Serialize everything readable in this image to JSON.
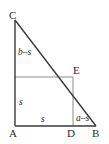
{
  "figure": {
    "type": "geometry-diagram",
    "width": 109,
    "height": 144,
    "background_color": "#ffffff",
    "stroke_color_outline": "#3a3a3a",
    "stroke_color_inner": "#8a8a8a",
    "label_color": "#2a2a2a"
  },
  "vertices": [
    {
      "id": "C",
      "label": "C",
      "x": 15,
      "y": 20
    },
    {
      "id": "E",
      "label": "E",
      "x": 73,
      "y": 77
    },
    {
      "id": "A",
      "label": "A",
      "x": 15,
      "y": 126
    },
    {
      "id": "D",
      "label": "D",
      "x": 73,
      "y": 126
    },
    {
      "id": "B",
      "label": "B",
      "x": 96,
      "y": 126
    }
  ],
  "segment_labels": [
    {
      "id": "b-minus-s",
      "label": "b–s",
      "segment": "C to square-top-left",
      "orientation": "vertical"
    },
    {
      "id": "s-vertical",
      "label": "s",
      "segment": "square-top-left to A",
      "orientation": "vertical"
    },
    {
      "id": "s-horizontal",
      "label": "s",
      "segment": "A to D",
      "orientation": "horizontal"
    },
    {
      "id": "a-minus-s",
      "label": "a–s",
      "segment": "D to B",
      "orientation": "horizontal"
    }
  ]
}
